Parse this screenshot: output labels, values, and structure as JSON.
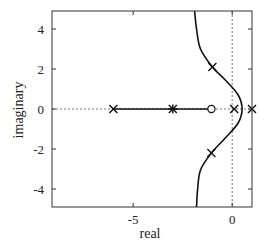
{
  "chart_data": {
    "type": "scatter",
    "title": "",
    "xlabel": "real",
    "ylabel": "imaginary",
    "xlim": [
      -9.1,
      1
    ],
    "ylim": [
      -4.9,
      4.9
    ],
    "x_ticks": [
      -5,
      0
    ],
    "x_tick_labels": [
      "-5",
      "0"
    ],
    "y_ticks": [
      4,
      2,
      0,
      -2,
      -4
    ],
    "y_tick_labels": [
      "4",
      "2",
      "0",
      "-2",
      "-4"
    ],
    "grid": false,
    "legend": null,
    "reference_lines": [
      {
        "orientation": "horizontal",
        "value": 0,
        "style": "dashed"
      },
      {
        "orientation": "vertical",
        "value": 0,
        "style": "dashed"
      }
    ],
    "poles": [
      {
        "real": -6.0,
        "imag": 0,
        "marker": "x"
      },
      {
        "real": -3.0,
        "imag": 0,
        "marker": "*"
      },
      {
        "real": 0.1,
        "imag": 0,
        "marker": "x"
      },
      {
        "real": 1.0,
        "imag": 0,
        "marker": "x"
      },
      {
        "real": -1.0,
        "imag": 2.1,
        "marker": "x"
      },
      {
        "real": -1.05,
        "imag": -2.2,
        "marker": "x"
      }
    ],
    "zeros": [
      {
        "real": -1.05,
        "imag": 0,
        "marker": "o"
      }
    ],
    "series": [
      {
        "name": "root-locus-real-segment",
        "style": "solid",
        "points": [
          [
            -6.0,
            0
          ],
          [
            -1.05,
            0
          ]
        ]
      },
      {
        "name": "root-locus-branch",
        "style": "solid",
        "points": [
          [
            -1.9,
            4.9
          ],
          [
            -1.8,
            4.0
          ],
          [
            -1.6,
            3.0
          ],
          [
            -1.0,
            2.1
          ],
          [
            -0.35,
            1.45
          ],
          [
            0.3,
            0.7
          ],
          [
            0.5,
            0.0
          ],
          [
            0.3,
            -0.7
          ],
          [
            -0.35,
            -1.45
          ],
          [
            -1.05,
            -2.2
          ],
          [
            -1.6,
            -3.05
          ],
          [
            -1.75,
            -4.05
          ],
          [
            -1.8,
            -4.9
          ]
        ]
      }
    ]
  }
}
